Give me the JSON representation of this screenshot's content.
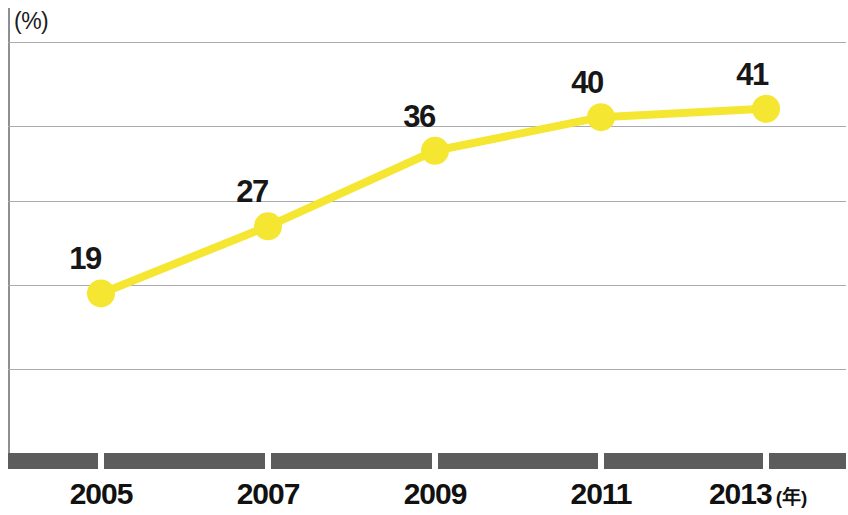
{
  "chart_data": {
    "type": "line",
    "title": "",
    "subtitle": "",
    "xlabel": "(年)",
    "ylabel": "(%)",
    "categories": [
      "2005",
      "2007",
      "2009",
      "2011",
      "2013"
    ],
    "x": [
      2005,
      2007,
      2009,
      2011,
      2013
    ],
    "values": [
      19,
      27,
      36,
      40,
      41
    ],
    "series": [
      {
        "name": "",
        "values": [
          19,
          27,
          36,
          40,
          41
        ]
      }
    ],
    "point_labels": [
      "19",
      "27",
      "36",
      "40",
      "41"
    ],
    "xlim": [
      2004,
      2014
    ],
    "ylim": [
      0,
      53
    ],
    "y_gridline_values": [
      49,
      39,
      30,
      20,
      10
    ],
    "grid": true,
    "grid_axis": "y",
    "legend": false,
    "legend_position": "none",
    "colors": {
      "series_line": "#F5E632",
      "marker_fill": "#F5E632",
      "gridline": "#a9abae",
      "axis_line": "#8d8f92",
      "axis_band": "#5c5c5c",
      "label_text": "#171717"
    },
    "marker": {
      "shape": "circle",
      "radius_px": 14
    },
    "line_width_px": 8,
    "annotations": []
  },
  "axes": {
    "y_unit_caption": "(%)",
    "x_unit_caption": "(年)"
  },
  "x_ticks": [
    {
      "label": "2005",
      "suffix": ""
    },
    {
      "label": "2007",
      "suffix": ""
    },
    {
      "label": "2009",
      "suffix": ""
    },
    {
      "label": "2011",
      "suffix": ""
    },
    {
      "label": "2013",
      "suffix": "(年)"
    }
  ]
}
